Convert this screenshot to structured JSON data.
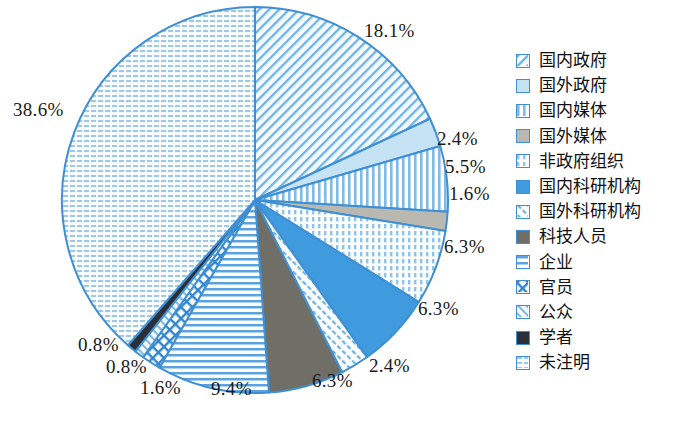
{
  "chart_data": {
    "type": "pie",
    "title": "",
    "unit": "%",
    "start_angle": 0,
    "direction": "clockwise",
    "categories": [
      "国内政府",
      "国外政府",
      "国内媒体",
      "国外媒体",
      "非政府组织",
      "国内科研机构",
      "国外科研机构",
      "科技人员",
      "企业",
      "官员",
      "公众",
      "学者",
      "未注明"
    ],
    "values": [
      18.1,
      2.4,
      5.5,
      1.6,
      6.3,
      6.3,
      2.4,
      6.3,
      9.4,
      1.6,
      0.8,
      0.8,
      38.6
    ],
    "labels": [
      "18.1%",
      "2.4%",
      "5.5%",
      "1.6%",
      "6.3%",
      "6.3%",
      "2.4%",
      "6.3%",
      "9.4%",
      "1.6%",
      "0.8%",
      "0.8%",
      "38.6%"
    ],
    "legend_position": "right",
    "outline_color": "#3f8fd4",
    "slice_styles": [
      {
        "name": "国内政府",
        "fill": "#f2f8fd",
        "pattern": "diagonal-hatch",
        "pattern_color": "#5ba3de"
      },
      {
        "name": "国外政府",
        "fill": "#c6e2f5",
        "pattern": "solid",
        "pattern_color": "#c6e2f5"
      },
      {
        "name": "国内媒体",
        "fill": "#ffffff",
        "pattern": "vertical-stripes",
        "pattern_color": "#7fbbe6"
      },
      {
        "name": "国外媒体",
        "fill": "#b9b9b2",
        "pattern": "solid",
        "pattern_color": "#b9b9b2"
      },
      {
        "name": "非政府组织",
        "fill": "#ffffff",
        "pattern": "vertical-dashes",
        "pattern_color": "#8fc4e8"
      },
      {
        "name": "国内科研机构",
        "fill": "#3f9ade",
        "pattern": "solid",
        "pattern_color": "#3f9ade"
      },
      {
        "name": "国外科研机构",
        "fill": "#fbfdff",
        "pattern": "diagonal-dashes",
        "pattern_color": "#6fb2e2"
      },
      {
        "name": "科技人员",
        "fill": "#6f6f68",
        "pattern": "solid",
        "pattern_color": "#6f6f68"
      },
      {
        "name": "企业",
        "fill": "#ffffff",
        "pattern": "horizontal-stripes",
        "pattern_color": "#5ba3de"
      },
      {
        "name": "官员",
        "fill": "#ffffff",
        "pattern": "cross-hatch",
        "pattern_color": "#2f86cf"
      },
      {
        "name": "公众",
        "fill": "#f4fafe",
        "pattern": "diagonal-hatch-light",
        "pattern_color": "#6fb2e2"
      },
      {
        "name": "学者",
        "fill": "#2b2f3a",
        "pattern": "solid",
        "pattern_color": "#2b2f3a"
      },
      {
        "name": "未注明",
        "fill": "#ffffff",
        "pattern": "fine-grid",
        "pattern_color": "#9cc8ea"
      }
    ]
  },
  "legend": {
    "items": [
      {
        "label": "国内政府"
      },
      {
        "label": "国外政府"
      },
      {
        "label": "国内媒体"
      },
      {
        "label": "国外媒体"
      },
      {
        "label": "非政府组织"
      },
      {
        "label": "国内科研机构"
      },
      {
        "label": "国外科研机构"
      },
      {
        "label": "科技人员"
      },
      {
        "label": "企业"
      },
      {
        "label": "官员"
      },
      {
        "label": "公众"
      },
      {
        "label": "学者"
      },
      {
        "label": "未注明"
      }
    ]
  },
  "pct_labels": [
    {
      "text": "18.1%",
      "x": 364,
      "y": 20
    },
    {
      "text": "2.4%",
      "x": 437,
      "y": 128
    },
    {
      "text": "5.5%",
      "x": 445,
      "y": 156
    },
    {
      "text": "1.6%",
      "x": 449,
      "y": 183
    },
    {
      "text": "6.3%",
      "x": 444,
      "y": 236
    },
    {
      "text": "6.3%",
      "x": 418,
      "y": 298
    },
    {
      "text": "2.4%",
      "x": 369,
      "y": 355
    },
    {
      "text": "6.3%",
      "x": 312,
      "y": 370
    },
    {
      "text": "9.4%",
      "x": 211,
      "y": 378
    },
    {
      "text": "1.6%",
      "x": 140,
      "y": 377
    },
    {
      "text": "0.8%",
      "x": 106,
      "y": 356
    },
    {
      "text": "0.8%",
      "x": 78,
      "y": 334
    },
    {
      "text": "38.6%",
      "x": 13,
      "y": 99
    }
  ]
}
